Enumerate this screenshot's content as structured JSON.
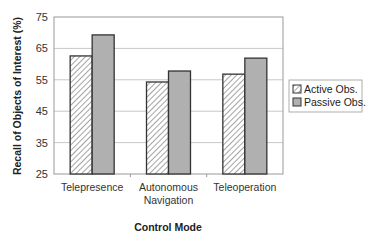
{
  "chart_data": {
    "type": "bar",
    "title": "",
    "xlabel": "Control Mode",
    "ylabel": "Recall of Objects of Interest (%)",
    "ylim": [
      25,
      75
    ],
    "yticks": [
      25,
      35,
      45,
      55,
      65,
      75
    ],
    "grid": true,
    "legend_position": "right",
    "categories": [
      [
        "Telepresence"
      ],
      [
        "Autonomous",
        "Navigation"
      ],
      [
        "Teleoperation"
      ]
    ],
    "category_labels": [
      "Telepresence",
      "Autonomous Navigation",
      "Teleoperation"
    ],
    "series": [
      {
        "name": "Active Obs.",
        "values": [
          62.6,
          54.3,
          56.8
        ],
        "pattern": "hatch",
        "color": "#ffffff"
      },
      {
        "name": "Passive Obs.",
        "values": [
          69.3,
          57.8,
          61.9
        ],
        "pattern": "solid",
        "color": "#b0b0b0"
      }
    ]
  },
  "colors": {
    "grid": "#c8c8c8",
    "bar_border": "#333333",
    "plot_border": "#999999",
    "hatch": "#555555"
  }
}
